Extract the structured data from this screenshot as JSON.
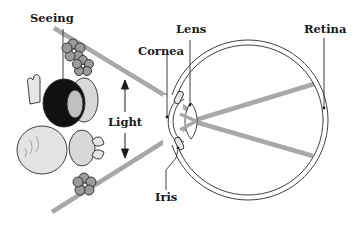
{
  "diagram": {
    "labels": {
      "seeing": "Seeing",
      "lens": "Lens",
      "retina": "Retina",
      "cornea": "Cornea",
      "light": "Light",
      "iris": "Iris"
    },
    "colors": {
      "light_ray": "#a8a8a8",
      "outline": "#2a2a2a",
      "hair": "#111111",
      "skin": "#e6e6e6",
      "flower": "#9a9a9a",
      "background": "#ffffff"
    }
  }
}
